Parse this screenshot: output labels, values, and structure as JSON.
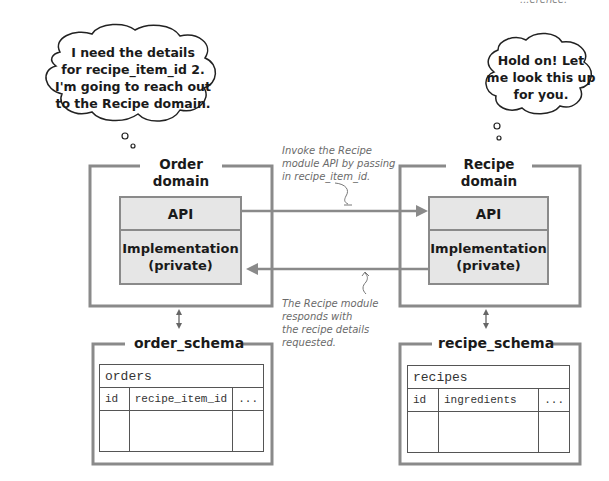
{
  "cutoff_text": "...erence.",
  "bubbles": {
    "order": {
      "lines": [
        "I need the details",
        "for recipe_item_id 2.",
        "I'm going to reach out",
        "to the Recipe domain."
      ]
    },
    "recipe": {
      "lines": [
        "Hold on! Let",
        "me look this up",
        "for you."
      ]
    }
  },
  "domains": {
    "order": {
      "title_line1": "Order",
      "title_line2": "domain",
      "api_label": "API",
      "impl_line1": "Implementation",
      "impl_line2": "(private)"
    },
    "recipe": {
      "title_line1": "Recipe",
      "title_line2": "domain",
      "api_label": "API",
      "impl_line1": "Implementation",
      "impl_line2": "(private)"
    }
  },
  "annotations": {
    "request": [
      "Invoke the Recipe",
      "module API by passing",
      "in recipe_item_id."
    ],
    "response": [
      "The Recipe module",
      "responds with",
      "the recipe details",
      "requested."
    ]
  },
  "schemas": {
    "order": {
      "title": "order_schema",
      "table_name": "orders",
      "columns": [
        "id",
        "recipe_item_id",
        "..."
      ]
    },
    "recipe": {
      "title": "recipe_schema",
      "table_name": "recipes",
      "columns": [
        "id",
        "ingredients",
        "..."
      ]
    }
  },
  "colors": {
    "frame": "#8a8a8a",
    "module_fill": "#e6e6e6",
    "arrow": "#8a8a8a",
    "note_text": "#6a6a6a"
  }
}
